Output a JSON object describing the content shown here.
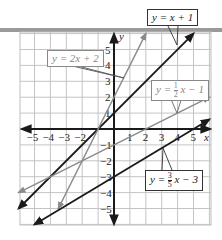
{
  "chart_data": {
    "type": "line",
    "title": "",
    "xlabel": "x",
    "ylabel": "y",
    "xlim": [
      -6,
      6
    ],
    "ylim": [
      -6,
      6
    ],
    "grid": true,
    "x_ticks": [
      "-5",
      "-4",
      "-3",
      "-2",
      "1",
      "2",
      "3",
      "4",
      "5"
    ],
    "y_ticks": [
      "5",
      "4",
      "3",
      "2",
      "1",
      "-1",
      "-2",
      "-3",
      "-4",
      "-5"
    ],
    "series": [
      {
        "name": "y = x + 1",
        "slope": 1,
        "intercept": 1,
        "color": "#1a1a1a",
        "x_range": [
          -6,
          5
        ],
        "points": [
          [
            -6,
            -5
          ],
          [
            -1,
            0
          ],
          [
            0,
            1
          ],
          [
            5,
            6
          ]
        ]
      },
      {
        "name": "y = 2x + 2",
        "slope": 2,
        "intercept": 2,
        "color": "#8a8a8a",
        "x_range": [
          -3.5,
          2
        ],
        "points": [
          [
            -3.5,
            -5
          ],
          [
            -1,
            0
          ],
          [
            0,
            2
          ],
          [
            2,
            6
          ]
        ]
      },
      {
        "name": "y = 1/2 x - 1",
        "slope": 0.5,
        "intercept": -1,
        "color": "#8a8a8a",
        "x_range": [
          -6,
          6
        ],
        "points": [
          [
            -6,
            -4
          ],
          [
            0,
            -1
          ],
          [
            2,
            0
          ],
          [
            6,
            2
          ]
        ]
      },
      {
        "name": "y = 3/5 x - 3",
        "slope": 0.6,
        "intercept": -3,
        "color": "#1a1a1a",
        "x_range": [
          -5,
          6
        ],
        "points": [
          [
            -5,
            -6
          ],
          [
            0,
            -3
          ],
          [
            5,
            0
          ],
          [
            6,
            0.6
          ]
        ]
      }
    ]
  },
  "labels": {
    "l1": {
      "y": "y",
      "eq": "=",
      "rest": "x + 1"
    },
    "l2": {
      "y": "y",
      "eq": "=",
      "rest": "2x + 2"
    },
    "l3": {
      "y": "y",
      "eq": "=",
      "num": "1",
      "den": "2",
      "rest": "x − 1"
    },
    "l4": {
      "y": "y",
      "eq": "=",
      "num": "3",
      "den": "5",
      "rest": "x − 3"
    }
  }
}
